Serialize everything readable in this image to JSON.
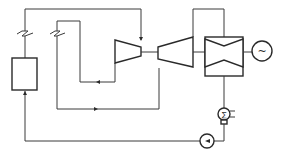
{
  "diagram": {
    "type": "thermodynamic cycle schematic",
    "components": [
      {
        "id": "heat-source-box",
        "label": ""
      },
      {
        "id": "low-pressure-compressor",
        "label": ""
      },
      {
        "id": "high-pressure-compressor",
        "label": ""
      },
      {
        "id": "turbine",
        "label": ""
      },
      {
        "id": "generator",
        "label": "",
        "symbol": "~"
      },
      {
        "id": "condenser",
        "label": "",
        "symbol": "Σ"
      },
      {
        "id": "pump",
        "label": ""
      }
    ],
    "generator_symbol": "~",
    "condenser_symbol": "∑",
    "colors": {
      "line": "#3a3a3a",
      "background": "#ffffff"
    }
  }
}
